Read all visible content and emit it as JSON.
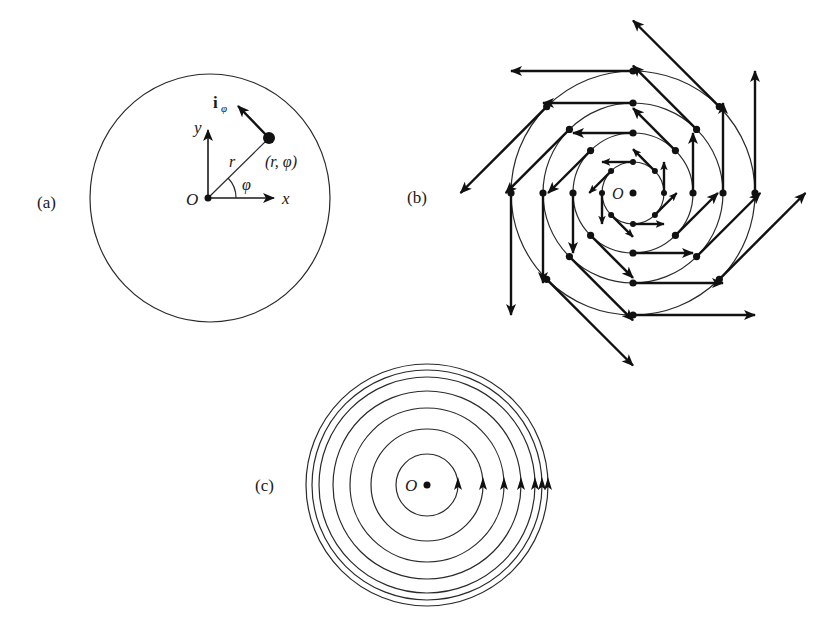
{
  "figure": {
    "panels": [
      {
        "id": "a",
        "label": "(a)",
        "description": "Single point on a circle with unit vector i_phi",
        "origin_label": "O",
        "x_axis_label": "x",
        "y_axis_label": "y",
        "radius_label": "r",
        "angle_label": "φ",
        "point_label": "(r, φ)",
        "vector_label_main": "i",
        "vector_label_sub": "φ"
      },
      {
        "id": "b",
        "label": "(b)",
        "description": "Tangential (counterclockwise) vector field with magnitude proportional to r",
        "origin_label": "O",
        "rings": [
          31,
          60,
          90,
          122
        ],
        "points_per_ring": 8,
        "arrow_length_factor": 1.0
      },
      {
        "id": "c",
        "label": "(c)",
        "description": "Concentric circular field lines with counterclockwise arrows",
        "origin_label": "O",
        "circle_radii": [
          31,
          56,
          77,
          94,
          108,
          115,
          121
        ]
      }
    ]
  }
}
